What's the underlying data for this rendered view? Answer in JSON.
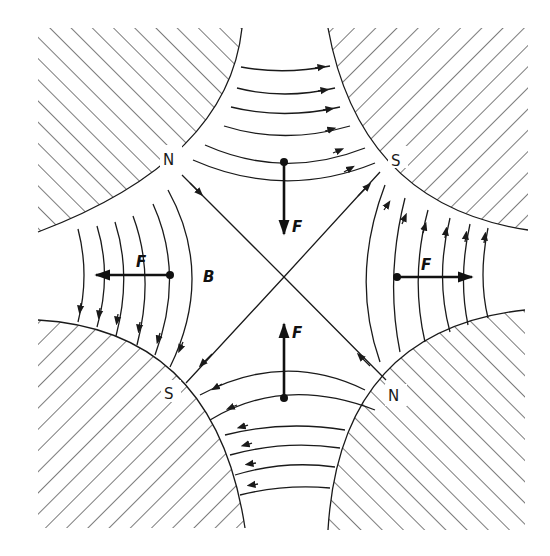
{
  "diagram": {
    "colors": {
      "ink": "#1a1a1a",
      "background": "#ffffff"
    },
    "poles": [
      {
        "position": "top-left",
        "label": "N"
      },
      {
        "position": "top-right",
        "label": "S"
      },
      {
        "position": "bottom-left",
        "label": "S"
      },
      {
        "position": "bottom-right",
        "label": "N"
      }
    ],
    "field_label": "B",
    "forces": [
      {
        "position": "top",
        "direction": "down",
        "label": "F"
      },
      {
        "position": "bottom",
        "direction": "up",
        "label": "F"
      },
      {
        "position": "left",
        "direction": "left",
        "label": "F"
      },
      {
        "position": "right",
        "direction": "right",
        "label": "F"
      }
    ]
  }
}
